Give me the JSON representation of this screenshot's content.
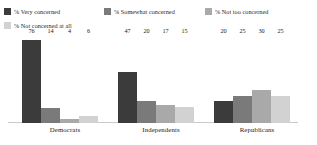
{
  "chart_data": {
    "type": "bar",
    "title": "",
    "subtitle": "",
    "xlabel": "",
    "ylabel": "",
    "ylim": [
      0,
      80
    ],
    "grid": false,
    "legend_position": "top-left",
    "categories": [
      "Democrats",
      "Independents",
      "Republicans"
    ],
    "series": [
      {
        "name": "% Very concerned",
        "color": "#3b3b3b",
        "values": [
          76,
          47,
          20
        ]
      },
      {
        "name": "% Somewhat concerned",
        "color": "#7a7a7a",
        "values": [
          14,
          20,
          25
        ]
      },
      {
        "name": "% Not too concerned",
        "color": "#a9a9a9",
        "values": [
          4,
          17,
          30
        ]
      },
      {
        "name": "% Not concerned at all",
        "color": "#d2d2d2",
        "values": [
          6,
          15,
          25
        ]
      }
    ]
  },
  "legend": {
    "items": [
      {
        "label": "% Very concerned",
        "color": "#3b3b3b"
      },
      {
        "label": "% Somewhat concerned",
        "color": "#7a7a7a"
      },
      {
        "label": "% Not too concerned",
        "color": "#a9a9a9"
      },
      {
        "label": "% Not concerned at all",
        "color": "#d2d2d2"
      }
    ]
  },
  "axis": {
    "categories": [
      {
        "label": "Democrats"
      },
      {
        "label": "Independents"
      },
      {
        "label": "Republicans"
      }
    ]
  },
  "values_text": {
    "democrats": [
      "76",
      "14",
      "4",
      "6"
    ],
    "independents": [
      "47",
      "20",
      "17",
      "15"
    ],
    "republicans": [
      "20",
      "25",
      "30",
      "25"
    ]
  }
}
